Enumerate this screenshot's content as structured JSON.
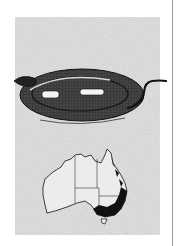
{
  "page": {
    "figure": {
      "illustration": "snake-illustration",
      "map": "australia-distribution-map",
      "map_regions": [
        "Western Australia",
        "Northern Territory",
        "Queensland",
        "South Australia",
        "New South Wales",
        "Victoria",
        "Tasmania"
      ],
      "distribution_shaded": "eastern coast and south-east",
      "colors": {
        "panel": "#e2e2e2",
        "ink": "#1a1a1a",
        "paper": "#ffffff",
        "rule": "#9a9a9a"
      }
    }
  }
}
